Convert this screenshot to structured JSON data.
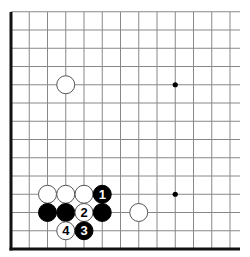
{
  "diagram": {
    "type": "go-board-fragment",
    "corner": "bottom-left",
    "grid": {
      "origin_x": 11,
      "origin_y": 249,
      "spacing": 18.25,
      "columns": 13,
      "rows": 14,
      "line_extend_right": 240,
      "line_extend_top": 12,
      "line_color": "#888888",
      "edge_color": "#111111"
    },
    "star_points": [
      {
        "col": 9,
        "row": 9
      },
      {
        "col": 9,
        "row": 3
      }
    ],
    "stones": [
      {
        "color": "white",
        "col": 3,
        "row": 9,
        "label": ""
      },
      {
        "color": "white",
        "col": 2,
        "row": 3,
        "label": ""
      },
      {
        "color": "white",
        "col": 3,
        "row": 3,
        "label": ""
      },
      {
        "color": "white",
        "col": 4,
        "row": 3,
        "label": ""
      },
      {
        "color": "black",
        "col": 5,
        "row": 3,
        "label": "1"
      },
      {
        "color": "black",
        "col": 2,
        "row": 2,
        "label": ""
      },
      {
        "color": "black",
        "col": 3,
        "row": 2,
        "label": ""
      },
      {
        "color": "white",
        "col": 4,
        "row": 2,
        "label": "2"
      },
      {
        "color": "black",
        "col": 5,
        "row": 2,
        "label": ""
      },
      {
        "color": "white",
        "col": 7,
        "row": 2,
        "label": ""
      },
      {
        "color": "white",
        "col": 3,
        "row": 1,
        "label": "4"
      },
      {
        "color": "black",
        "col": 4,
        "row": 1,
        "label": "3"
      }
    ],
    "colors": {
      "black_stone": "#000000",
      "white_stone": "#ffffff",
      "white_stone_stroke": "#555555"
    }
  }
}
